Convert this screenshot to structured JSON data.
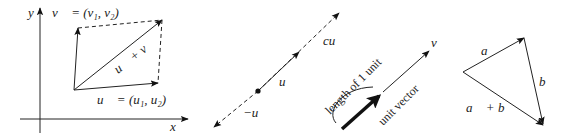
{
  "figure": {
    "panels": [
      {
        "name": "vector-addition-parallelogram",
        "axis_labels": {
          "x": "x",
          "y": "y"
        },
        "labels": {
          "v": "v⃗ = (v₁, v₂)",
          "u": "u⃗ = (u₁, u₂)",
          "sum": "u⃗ + v⃗"
        }
      },
      {
        "name": "scalar-multiplication",
        "labels": {
          "cu": "cu⃗",
          "u": "u⃗",
          "neg_u": "−u⃗"
        }
      },
      {
        "name": "unit-vector",
        "labels": {
          "v": "v⃗",
          "length": "length of 1 unit",
          "unit": "unit vector"
        }
      },
      {
        "name": "triangle-addition",
        "labels": {
          "a": "a⃗",
          "b": "b⃗",
          "sum": "a⃗ + b⃗"
        }
      }
    ]
  }
}
